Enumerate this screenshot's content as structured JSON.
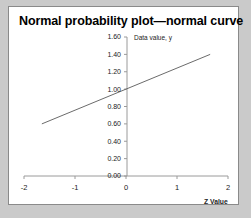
{
  "chart_data": {
    "type": "line",
    "title": "Normal probability plot—normal curve",
    "xlabel": "Z Value",
    "ylabel": "Data value, y",
    "xlim": [
      -2,
      2
    ],
    "ylim": [
      0.0,
      1.6
    ],
    "xticks": [
      "-2",
      "-1",
      "0",
      "1",
      "2"
    ],
    "xtick_values": [
      -2,
      -1,
      0,
      1,
      2
    ],
    "yticks": [
      "0.00",
      "0.20",
      "0.40",
      "0.60",
      "0.80",
      "1.00",
      "1.20",
      "1.40",
      "1.60"
    ],
    "ytick_values": [
      0.0,
      0.2,
      0.4,
      0.6,
      0.8,
      1.0,
      1.2,
      1.4,
      1.6
    ],
    "grid": false,
    "legend": null,
    "series": [
      {
        "name": "normal curve",
        "x": [
          -1.65,
          1.65
        ],
        "y": [
          0.6,
          1.4
        ],
        "slope": 0.2424,
        "intercept": 1.0,
        "color": "#6b6b6b"
      }
    ]
  },
  "colors": {
    "background": "#cacaca",
    "panel": "#ffffff",
    "panel_border": "#8a8a8a",
    "axis": "#9a9a9a",
    "line": "#6b6b6b",
    "text": "#000000"
  }
}
